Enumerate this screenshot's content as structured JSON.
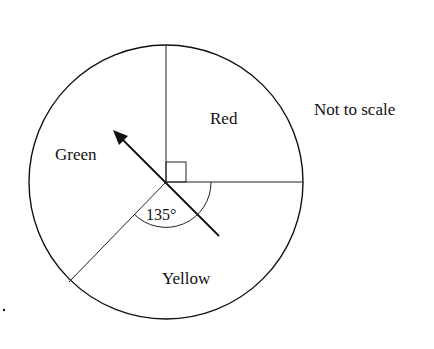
{
  "diagram": {
    "type": "pie-spinner",
    "sectors": [
      {
        "label": "Red",
        "angle_deg": 90
      },
      {
        "label": "Yellow",
        "angle_deg": 135
      },
      {
        "label": "Green",
        "angle_deg": 135
      }
    ],
    "angle_label": "135°",
    "note": "Not to scale",
    "right_angle_marker": true,
    "pointer": "arrow"
  },
  "colors": {
    "stroke": "#111111",
    "background": "#ffffff"
  }
}
